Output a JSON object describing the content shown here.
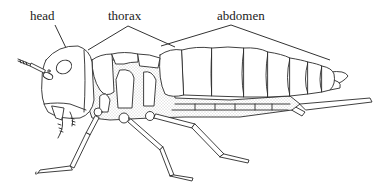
{
  "diagram": {
    "labels": {
      "head": "head",
      "thorax": "thorax",
      "abdomen": "abdomen"
    },
    "label_positions": {
      "head": {
        "x": 30,
        "y": 9
      },
      "thorax": {
        "x": 108,
        "y": 9
      },
      "abdomen": {
        "x": 217,
        "y": 9
      }
    },
    "colors": {
      "line": "#2a2a2a",
      "stipple": "#9a9a9a",
      "background": "#ffffff",
      "text": "#222222"
    }
  }
}
